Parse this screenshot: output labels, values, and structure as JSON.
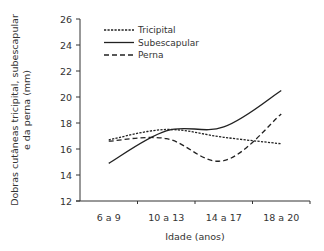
{
  "chart_data": {
    "type": "line",
    "title": "",
    "xlabel": "Idade (anos)",
    "ylabel": [
      "Dobras cutâneas tricipital, subescapular",
      "e da perna (mm)"
    ],
    "categories": [
      "6 a 9",
      "10 a 13",
      "14 a 17",
      "18 a 20"
    ],
    "ylim": [
      12,
      26
    ],
    "yticks": [
      12,
      14,
      16,
      18,
      20,
      22,
      24,
      26
    ],
    "grid": false,
    "legend_position": "top-left inside",
    "series": [
      {
        "name": "Tricipital",
        "style": "dotted-dense",
        "values": [
          16.7,
          17.5,
          16.9,
          16.4
        ]
      },
      {
        "name": "Subescapular",
        "style": "solid",
        "values": [
          14.9,
          17.4,
          17.7,
          20.5
        ]
      },
      {
        "name": "Perna",
        "style": "dashed",
        "values": [
          16.6,
          16.8,
          15.1,
          18.7
        ]
      }
    ]
  },
  "colors": {
    "line": "#222222",
    "axis": "#333333",
    "text": "#333333"
  }
}
